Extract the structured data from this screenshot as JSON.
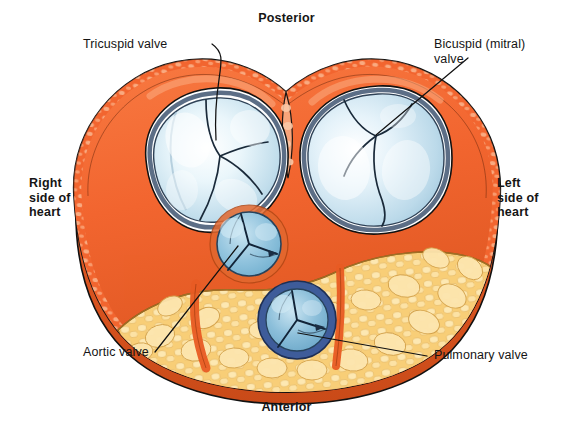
{
  "figure": {
    "orientation": {
      "posterior": "Posterior",
      "anterior": "Anterior",
      "right": "Right\nside of\nheart",
      "left": "Left\nside of\nheart"
    },
    "callouts": [
      {
        "id": "tricuspid",
        "label": "Tricuspid valve"
      },
      {
        "id": "bicuspid",
        "label": "Bicuspid (mitral)\nvalve"
      },
      {
        "id": "aortic",
        "label": "Aortic valve"
      },
      {
        "id": "pulmonary",
        "label": "Pulmonary valve"
      }
    ],
    "colors": {
      "myocardium": "#F2652F",
      "myocardium_light": "#F79363",
      "myocardium_dark": "#D94E1C",
      "myocardium_texture": "#F9A87E",
      "cusp_blue": "#BFDCEA",
      "cusp_blue_light": "#EAF5FA",
      "cusp_outline": "#3C4D63",
      "aortic_blue": "#7FB9D6",
      "pulmonary_ring": "#3E5C9A",
      "fat_yellow": "#F8CE78",
      "fat_light": "#FBE2A6",
      "fat_outline": "#C79A3E",
      "outline": "#111111",
      "background": "#FFFFFF",
      "text": "#151515"
    }
  }
}
